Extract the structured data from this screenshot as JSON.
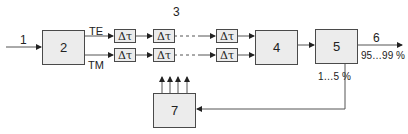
{
  "diagram": {
    "input_label": "1",
    "blocks": [
      {
        "id": "2",
        "label": "2"
      },
      {
        "id": "3",
        "label": "3"
      },
      {
        "id": "4",
        "label": "4"
      },
      {
        "id": "5",
        "label": "5"
      },
      {
        "id": "7",
        "label": "7"
      }
    ],
    "channels": {
      "top": "TE",
      "bottom": "TM"
    },
    "delay_label": "Δτ",
    "output": {
      "label": "6",
      "ratio": "95…99 %"
    },
    "feedback_ratio": "1…5 %"
  }
}
